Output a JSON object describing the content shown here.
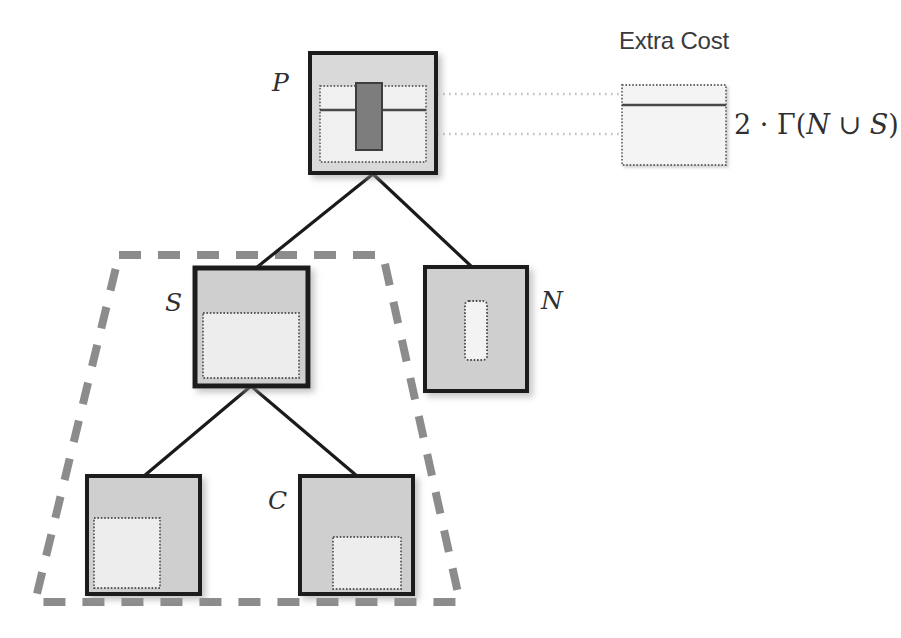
{
  "figure": {
    "title_label": "Extra Cost",
    "formula": {
      "prefix": "2 · Γ(",
      "var_n": "N",
      "union": " ∪ ",
      "var_s": "S",
      "suffix": ")"
    }
  },
  "nodes": {
    "p": {
      "label": "P"
    },
    "s": {
      "label": "S"
    },
    "n": {
      "label": "N"
    },
    "c": {
      "label": "C"
    }
  },
  "colors": {
    "node_fill": "#d0d0d0",
    "node_inner_fill": "#ececec",
    "node_border": "#1a1a1a",
    "dark_block": "#7a7a7a",
    "dotted_border": "#555555",
    "dashed_region": "#8c8c8c",
    "edge": "#1a1a1a",
    "connector": "#bfbfbf",
    "text": "#2f2f2f",
    "background": "#ffffff"
  },
  "geometry": {
    "p_box": {
      "x": 310,
      "y": 53,
      "w": 126,
      "h": 120
    },
    "s_box": {
      "x": 195,
      "y": 268,
      "w": 113,
      "h": 118
    },
    "n_box": {
      "x": 425,
      "y": 267,
      "w": 102,
      "h": 124
    },
    "c_left": {
      "x": 87,
      "y": 476,
      "w": 113,
      "h": 118
    },
    "c_right": {
      "x": 300,
      "y": 476,
      "w": 113,
      "h": 118
    },
    "zoom_box": {
      "x": 622,
      "y": 85,
      "w": 104,
      "h": 80
    },
    "region_trapezoid": "119,255 383,255 460,602 35,602"
  }
}
